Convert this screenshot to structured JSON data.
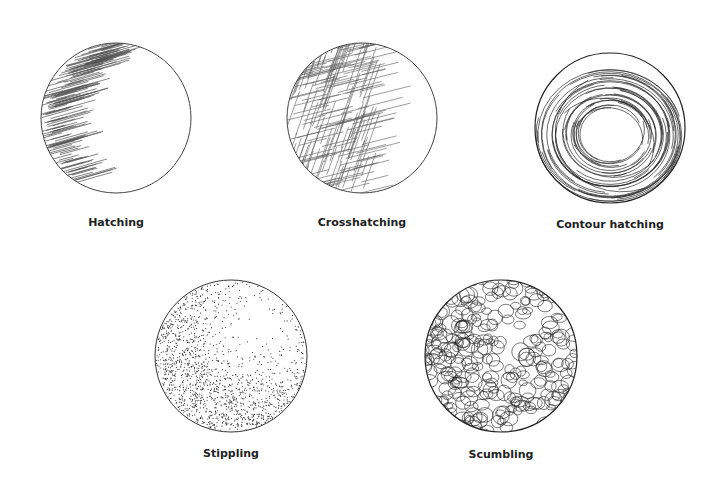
{
  "figure": {
    "background": "#ffffff",
    "ink_color": "#2a2a2a",
    "items": [
      {
        "label": "Hatching",
        "technique": "parallel diagonal lines shading lower-left",
        "cx": 116,
        "cy": 118,
        "r": 75
      },
      {
        "label": "Crosshatching",
        "technique": "intersecting line layers shading left side",
        "cx": 362,
        "cy": 118,
        "r": 75
      },
      {
        "label": "Contour hatching",
        "technique": "curved strokes following sphere contour",
        "cx": 610,
        "cy": 128,
        "r": 75
      },
      {
        "label": "Stippling",
        "technique": "dots denser toward lower-left",
        "cx": 231,
        "cy": 356,
        "r": 76
      },
      {
        "label": "Scumbling",
        "technique": "overlapping scribbled loops",
        "cx": 501,
        "cy": 356,
        "r": 76
      }
    ]
  }
}
